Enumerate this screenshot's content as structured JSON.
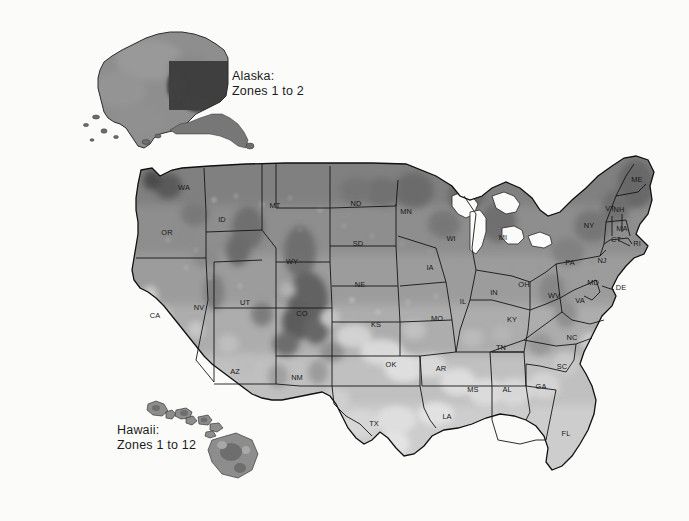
{
  "figure": {
    "kind": "map",
    "background_color": "#fbfbfa"
  },
  "insets": [
    {
      "id": "alaska",
      "title": "Alaska:",
      "zones": "Zones 1 to 2",
      "label_text": "Alaska:\nZones 1 to 2"
    },
    {
      "id": "hawaii",
      "title": "Hawaii:",
      "zones": "Zones 1 to 12",
      "label_text": "Hawaii:\nZones 1 to 12"
    }
  ],
  "palette": {
    "zone_1": "#4a4a4a",
    "zone_2": "#5a5a5a",
    "zone_3": "#6b6b6b",
    "zone_4": "#7b7b7b",
    "zone_5": "#8b8b8b",
    "zone_6": "#9a9a9a",
    "zone_7": "#a8a8a8",
    "zone_8": "#b8b8b8",
    "zone_9": "#c8c8c8",
    "zone_10": "#d8d8d8",
    "zone_11": "#e8e8e8",
    "zone_12": "#f2f2f2",
    "outline": "#141414",
    "water": "#fbfbfa"
  },
  "states": [
    {
      "abbr": "WA",
      "x": 184,
      "y": 190,
      "tone": "#8a8a8a"
    },
    {
      "abbr": "OR",
      "x": 167,
      "y": 235,
      "tone": "#989898"
    },
    {
      "abbr": "CA",
      "x": 155,
      "y": 318,
      "tone": "#b4b4b4"
    },
    {
      "abbr": "NV",
      "x": 199,
      "y": 310,
      "tone": "#a6a6a6"
    },
    {
      "abbr": "ID",
      "x": 222,
      "y": 222,
      "tone": "#8e8e8e"
    },
    {
      "abbr": "MT",
      "x": 275,
      "y": 208,
      "tone": "#818181"
    },
    {
      "abbr": "WY",
      "x": 292,
      "y": 264,
      "tone": "#8a8a8a"
    },
    {
      "abbr": "UT",
      "x": 245,
      "y": 305,
      "tone": "#a4a4a4"
    },
    {
      "abbr": "CO",
      "x": 302,
      "y": 316,
      "tone": "#9c9c9c"
    },
    {
      "abbr": "AZ",
      "x": 235,
      "y": 374,
      "tone": "#b0b0b0"
    },
    {
      "abbr": "NM",
      "x": 297,
      "y": 380,
      "tone": "#aaaaaa"
    },
    {
      "abbr": "ND",
      "x": 356,
      "y": 206,
      "tone": "#7a7a7a"
    },
    {
      "abbr": "SD",
      "x": 358,
      "y": 246,
      "tone": "#898989"
    },
    {
      "abbr": "NE",
      "x": 360,
      "y": 287,
      "tone": "#9a9a9a"
    },
    {
      "abbr": "KS",
      "x": 376,
      "y": 327,
      "tone": "#b0b0b0"
    },
    {
      "abbr": "OK",
      "x": 391,
      "y": 367,
      "tone": "#c6c6c6"
    },
    {
      "abbr": "TX",
      "x": 374,
      "y": 426,
      "tone": "#c2c2c2"
    },
    {
      "abbr": "MN",
      "x": 406,
      "y": 214,
      "tone": "#7d7d7d"
    },
    {
      "abbr": "IA",
      "x": 430,
      "y": 270,
      "tone": "#939393"
    },
    {
      "abbr": "MO",
      "x": 437,
      "y": 321,
      "tone": "#a6a6a6"
    },
    {
      "abbr": "AR",
      "x": 441,
      "y": 371,
      "tone": "#bcbcbc"
    },
    {
      "abbr": "LA",
      "x": 447,
      "y": 419,
      "tone": "#cbcbcb"
    },
    {
      "abbr": "WI",
      "x": 451,
      "y": 241,
      "tone": "#828282"
    },
    {
      "abbr": "IL",
      "x": 463,
      "y": 304,
      "tone": "#a0a0a0"
    },
    {
      "abbr": "MS",
      "x": 473,
      "y": 392,
      "tone": "#c4c4c4"
    },
    {
      "abbr": "MI",
      "x": 503,
      "y": 240,
      "tone": "#828282"
    },
    {
      "abbr": "IN",
      "x": 494,
      "y": 295,
      "tone": "#9c9c9c"
    },
    {
      "abbr": "KY",
      "x": 512,
      "y": 322,
      "tone": "#a4a4a4"
    },
    {
      "abbr": "TN",
      "x": 501,
      "y": 350,
      "tone": "#aeaeae"
    },
    {
      "abbr": "AL",
      "x": 507,
      "y": 392,
      "tone": "#c0c0c0"
    },
    {
      "abbr": "GA",
      "x": 541,
      "y": 389,
      "tone": "#bcbcbc"
    },
    {
      "abbr": "FL",
      "x": 566,
      "y": 436,
      "tone": "#b6b6b6"
    },
    {
      "abbr": "SC",
      "x": 562,
      "y": 369,
      "tone": "#b4b4b4"
    },
    {
      "abbr": "NC",
      "x": 572,
      "y": 340,
      "tone": "#ababab"
    },
    {
      "abbr": "VA",
      "x": 580,
      "y": 303,
      "tone": "#9e9e9e"
    },
    {
      "abbr": "WV",
      "x": 554,
      "y": 298,
      "tone": "#939393"
    },
    {
      "abbr": "OH",
      "x": 524,
      "y": 287,
      "tone": "#949494"
    },
    {
      "abbr": "PA",
      "x": 570,
      "y": 265,
      "tone": "#8d8d8d"
    },
    {
      "abbr": "NY",
      "x": 589,
      "y": 228,
      "tone": "#828282"
    },
    {
      "abbr": "ME",
      "x": 637,
      "y": 182,
      "tone": "#6e6e6e"
    },
    {
      "abbr": "VT",
      "x": 610,
      "y": 211,
      "tone": "#767676"
    },
    {
      "abbr": "NH",
      "x": 619,
      "y": 212,
      "tone": "#757575"
    },
    {
      "abbr": "MA",
      "x": 622,
      "y": 231,
      "tone": "#7e7e7e"
    },
    {
      "abbr": "CT",
      "x": 616,
      "y": 242,
      "tone": "#848484"
    },
    {
      "abbr": "RI",
      "x": 637,
      "y": 246,
      "tone": "#848484"
    },
    {
      "abbr": "NJ",
      "x": 602,
      "y": 263,
      "tone": "#8c8c8c"
    },
    {
      "abbr": "MD",
      "x": 593,
      "y": 285,
      "tone": "#939393"
    },
    {
      "abbr": "DE",
      "x": 621,
      "y": 290,
      "tone": "#919191"
    }
  ],
  "leader_labels": [
    {
      "abbr": "RI",
      "x": 637,
      "y": 246
    },
    {
      "abbr": "DE",
      "x": 621,
      "y": 290
    }
  ]
}
